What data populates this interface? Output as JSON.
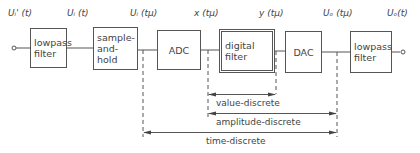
{
  "diagram": {
    "type": "signal-processing-block-diagram",
    "input_terminal": {
      "label": "U'_i(t)",
      "text": "Uᵢ' (t)"
    },
    "signals": [
      {
        "id": "ui_prime_t",
        "text": "Uᵢ' (t)"
      },
      {
        "id": "ui_t",
        "text": "Uᵢ (t)"
      },
      {
        "id": "ui_tmu",
        "text": "Uᵢ (tμ)"
      },
      {
        "id": "x_tmu",
        "text": "x (tμ)"
      },
      {
        "id": "y_tmu",
        "text": "y (tμ)"
      },
      {
        "id": "uo_tmu",
        "text": "Uₒ (tμ)"
      },
      {
        "id": "uo_t",
        "text": "Uₒ(t)"
      }
    ],
    "blocks": [
      {
        "id": "lowpass-in",
        "text": "lowpass\nfilter"
      },
      {
        "id": "sample-hold",
        "text": "sample-\nand-\nhold"
      },
      {
        "id": "adc",
        "text": "ADC"
      },
      {
        "id": "digital-filter",
        "text": "digital\nfilter"
      },
      {
        "id": "dac",
        "text": "DAC"
      },
      {
        "id": "lowpass-out",
        "text": "lowpass\nfilter"
      }
    ],
    "ranges": [
      {
        "id": "value-discrete",
        "text": "value-discrete",
        "from": "x (tμ)",
        "to": "y (tμ)"
      },
      {
        "id": "amplitude-discrete",
        "text": "amplitude-discrete",
        "from": "x (tμ)",
        "to": "Uₒ (tμ)"
      },
      {
        "id": "time-discrete",
        "text": "time-discrete",
        "from": "Uᵢ (tμ)",
        "to": "Uₒ (tμ)"
      }
    ],
    "colors": {
      "line": "#555555",
      "text": "#444444",
      "background": "#ffffff"
    }
  }
}
